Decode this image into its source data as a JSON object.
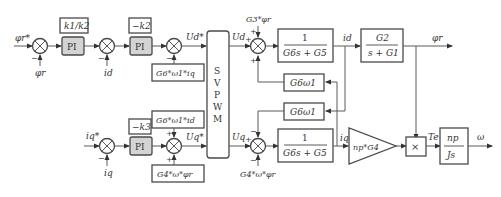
{
  "diagram": {
    "inputs": {
      "flux_ref": "φr*",
      "flux_fb": "φr",
      "id_fb": "id",
      "iq_ref": "iq*",
      "iq_fb": "iq"
    },
    "blocks": {
      "gain_k1k2": "k1/k2",
      "pi1": "PI",
      "gain_negk2": "−k2",
      "pi2": "PI",
      "gain_negk3": "−k3",
      "pi3": "PI",
      "svpwm": [
        "S",
        "V",
        "P",
        "W",
        "M"
      ],
      "decouple_d": "G6*ω1*iq",
      "decouple_q1": "G6*ω1*id",
      "decouple_q2": "G4*ω*φr",
      "plant_d_num": "1",
      "plant_d_den": "G6s + G5",
      "plant_q_num": "1",
      "plant_q_den": "G6s + G5",
      "cross_upper": "G6ω1",
      "cross_lower": "G6ω1",
      "flux_num": "G2",
      "flux_den": "s + G1",
      "torque_gain": "np*G4",
      "multiplier": "×",
      "mech_num": "np",
      "mech_den": "Js"
    },
    "signals": {
      "ud_star": "Ud*",
      "uq_star": "Uq*",
      "ud": "Ud",
      "uq": "Uq",
      "id_out": "id",
      "iq_out": "iq",
      "flux_out": "φr",
      "torque": "Te",
      "speed": "ω",
      "d_disturbance": "G3*φr",
      "q_disturbance": "G4*ω*φr"
    },
    "signs": {
      "minus": "−",
      "plus": "+"
    }
  }
}
